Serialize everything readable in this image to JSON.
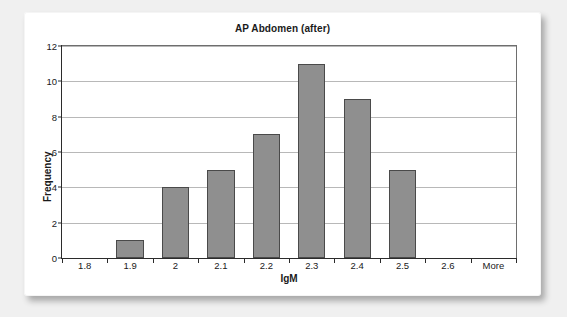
{
  "chart_data": {
    "type": "bar",
    "title": "AP Abdomen (after)",
    "xlabel": "IgM",
    "ylabel": "Frequency",
    "categories": [
      "1.8",
      "1.9",
      "2",
      "2.1",
      "2.2",
      "2.3",
      "2.4",
      "2.5",
      "2.6",
      "More"
    ],
    "values": [
      0,
      1,
      4,
      5,
      7,
      11,
      9,
      5,
      0,
      0
    ],
    "ylim": [
      0,
      12
    ],
    "yticks": [
      0,
      2,
      4,
      6,
      8,
      10,
      12
    ],
    "ytick_labels": [
      "0",
      "2",
      "4",
      "6",
      "8",
      "10",
      "12"
    ],
    "grid": true,
    "legend": false,
    "bar_color": "#8f8f8f",
    "bar_border_color": "#4a4a4a",
    "gridline_color": "#b8b8b8",
    "axis_color": "#2b2b2b",
    "plot_background": "#ffffff",
    "page_background": "#f0f0f0"
  }
}
